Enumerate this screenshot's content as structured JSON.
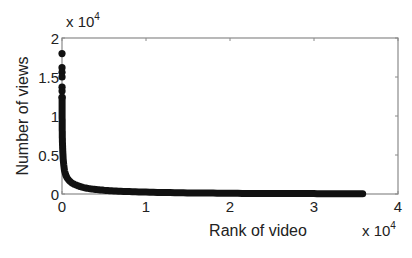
{
  "chart_data": {
    "type": "scatter",
    "title": "",
    "xlabel": "Rank of video",
    "ylabel": "Number of views",
    "x_multiplier": "x 10",
    "x_multiplier_exp": "4",
    "y_multiplier": "x 10",
    "y_multiplier_exp": "4",
    "xlim": [
      0,
      40000
    ],
    "ylim": [
      0,
      20000
    ],
    "x_ticks": [
      0,
      10000,
      20000,
      30000,
      40000
    ],
    "x_tick_labels": [
      "0",
      "1",
      "2",
      "3",
      "4"
    ],
    "y_ticks": [
      0,
      5000,
      10000,
      15000,
      20000
    ],
    "y_tick_labels": [
      "0",
      "0.5",
      "1",
      "1.5",
      "2"
    ],
    "grid": false,
    "legend": null,
    "marker": "filled-circle",
    "color": "#111111",
    "series": [
      {
        "name": "views by rank",
        "x": [
          1,
          2,
          3,
          4,
          5,
          6,
          8,
          10,
          15,
          20,
          30,
          50,
          80,
          120,
          200,
          300,
          500,
          800,
          1200,
          1800,
          2500,
          3500,
          5000,
          7000,
          10000,
          14000,
          18000,
          22000,
          26000,
          30000,
          33000,
          35800
        ],
        "y": [
          18000,
          16200,
          15600,
          15000,
          13700,
          13200,
          12400,
          11500,
          10200,
          9200,
          8000,
          6800,
          5800,
          4900,
          3800,
          3000,
          2300,
          1800,
          1400,
          1100,
          850,
          650,
          480,
          350,
          240,
          160,
          110,
          80,
          60,
          45,
          35,
          25
        ]
      }
    ]
  }
}
